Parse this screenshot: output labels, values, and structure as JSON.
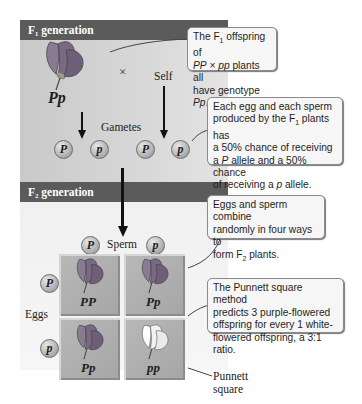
{
  "f1": {
    "header": "F₁ generation",
    "parent_genotype": "Pp",
    "cross_symbol": "×",
    "self_label": "Self",
    "gametes_label": "Gametes",
    "gametes": [
      "P",
      "p",
      "P",
      "p"
    ]
  },
  "f2": {
    "header": "F₂ generation",
    "sperm_label": "Sperm",
    "eggs_label": "Eggs",
    "sperm_alleles": [
      "P",
      "p"
    ],
    "egg_alleles": [
      "P",
      "p"
    ],
    "punnett_cells": [
      {
        "genotype": "PP",
        "flower_color": "purple"
      },
      {
        "genotype": "Pp",
        "flower_color": "purple"
      },
      {
        "genotype": "Pp",
        "flower_color": "purple"
      },
      {
        "genotype": "pp",
        "flower_color": "white"
      }
    ],
    "punnett_label": [
      "Punnett",
      "square"
    ]
  },
  "callouts": {
    "c1": [
      "The F",
      "1",
      " offspring of",
      "PP",
      " × ",
      "pp",
      " plants all",
      "have genotype ",
      "Pp",
      "."
    ],
    "c2": [
      "Each egg and each sperm",
      "produced by the F",
      "1",
      " plants has",
      "a 50% chance of receiving",
      "a ",
      "P",
      " allele and a 50% chance",
      "of receiving a ",
      "p",
      " allele."
    ],
    "c3": [
      "Eggs and sperm combine",
      "randomly in four ways to",
      "form F",
      "2",
      " plants."
    ],
    "c4": [
      "The Punnett square method",
      "predicts 3 purple-flowered",
      "offspring for every 1 white-",
      "flowered offspring, a 3:1 ratio."
    ]
  },
  "colors": {
    "purple_flower": "#7a6a80",
    "white_flower": "#f4f4f2",
    "header_bg": "#5b5b5b"
  }
}
